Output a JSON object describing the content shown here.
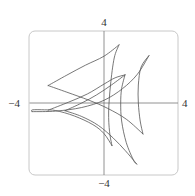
{
  "chart_data": {
    "type": "line",
    "title": "",
    "xlabel": "",
    "ylabel": "",
    "xlim": [
      -4,
      4
    ],
    "ylim": [
      -4,
      4
    ],
    "grid": false,
    "legend": "none",
    "tick_labels": {
      "x_min": "−4",
      "x_max": "4",
      "y_min": "−4",
      "y_max": "4"
    },
    "series": [
      {
        "name": "left-upper-arc",
        "points": [
          [
            -3.01,
            0.97
          ],
          [
            -2.0,
            1.55
          ],
          [
            -1.0,
            2.1
          ],
          [
            0.0,
            2.6
          ],
          [
            0.81,
            3.23
          ]
        ]
      },
      {
        "name": "left-inner-vertical",
        "points": [
          [
            0.81,
            3.23
          ],
          [
            0.55,
            2.5
          ],
          [
            0.35,
            1.0
          ],
          [
            0.25,
            -0.5
          ],
          [
            0.3,
            -1.6
          ],
          [
            0.43,
            -2.37
          ]
        ]
      },
      {
        "name": "left-lower-arc",
        "points": [
          [
            -3.01,
            0.97
          ],
          [
            -2.0,
            0.6
          ],
          [
            -0.8,
            0.15
          ],
          [
            0.2,
            -0.3
          ],
          [
            1.2,
            -0.9
          ],
          [
            2.1,
            -1.72
          ]
        ]
      },
      {
        "name": "right-vertical",
        "points": [
          [
            2.42,
            2.63
          ],
          [
            2.0,
            2.0
          ],
          [
            1.85,
            1.0
          ],
          [
            1.85,
            0.0
          ],
          [
            1.95,
            -1.0
          ],
          [
            2.1,
            -1.72
          ]
        ]
      },
      {
        "name": "right-long-arc",
        "points": [
          [
            2.42,
            2.63
          ],
          [
            1.8,
            1.6
          ],
          [
            1.0,
            0.8
          ],
          [
            0.0,
            0.15
          ],
          [
            -1.2,
            -0.25
          ],
          [
            -2.6,
            -0.45
          ],
          [
            -3.87,
            -0.48
          ]
        ]
      },
      {
        "name": "left-loop",
        "points": [
          [
            -3.87,
            -0.48
          ],
          [
            -3.85,
            -0.38
          ],
          [
            -3.2,
            -0.38
          ],
          [
            -2.6,
            -0.42
          ],
          [
            -1.6,
            -0.72
          ],
          [
            -0.6,
            -1.2
          ],
          [
            0.0,
            -1.7
          ],
          [
            0.43,
            -2.37
          ]
        ]
      },
      {
        "name": "inner-cusp-arc",
        "points": [
          [
            1.13,
            1.56
          ],
          [
            0.4,
            1.0
          ],
          [
            -0.4,
            0.45
          ],
          [
            -1.2,
            0.0
          ],
          [
            -2.1,
            -0.43
          ]
        ]
      },
      {
        "name": "inner-vertical",
        "points": [
          [
            1.13,
            1.56
          ],
          [
            0.95,
            0.8
          ],
          [
            0.9,
            0.0
          ],
          [
            0.95,
            -1.0
          ],
          [
            1.2,
            -2.2
          ],
          [
            1.6,
            -3.2
          ],
          [
            1.77,
            -3.39
          ]
        ]
      },
      {
        "name": "inner-lower-arc",
        "points": [
          [
            -2.1,
            -0.43
          ],
          [
            -1.2,
            -0.75
          ],
          [
            -0.3,
            -1.25
          ],
          [
            0.5,
            -1.95
          ],
          [
            1.15,
            -2.65
          ],
          [
            1.65,
            -3.25
          ],
          [
            1.77,
            -3.39
          ]
        ]
      },
      {
        "name": "top-connector",
        "points": [
          [
            1.13,
            1.56
          ],
          [
            0.6,
            1.4
          ],
          [
            0.0,
            1.05
          ],
          [
            -0.9,
            0.5
          ],
          [
            -1.9,
            0.05
          ],
          [
            -3.01,
            -0.4
          ]
        ]
      }
    ]
  }
}
